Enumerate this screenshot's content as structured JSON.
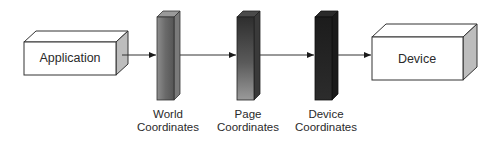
{
  "diagram": {
    "type": "pipeline",
    "nodes": [
      {
        "id": "application",
        "label": "Application",
        "shape": "box-3d"
      },
      {
        "id": "world",
        "label_line1": "World",
        "label_line2": "Coordinates",
        "shape": "bar-3d",
        "shade": "medium-gray"
      },
      {
        "id": "page",
        "label_line1": "Page",
        "label_line2": "Coordinates",
        "shape": "bar-3d",
        "shade": "dark-gradient"
      },
      {
        "id": "device_coords",
        "label_line1": "Device",
        "label_line2": "Coordinates",
        "shape": "bar-3d",
        "shade": "near-black"
      },
      {
        "id": "device",
        "label": "Device",
        "shape": "box-3d"
      }
    ],
    "edges": [
      {
        "from": "application",
        "to": "world"
      },
      {
        "from": "world",
        "to": "page"
      },
      {
        "from": "page",
        "to": "device_coords"
      },
      {
        "from": "device_coords",
        "to": "device"
      }
    ]
  }
}
